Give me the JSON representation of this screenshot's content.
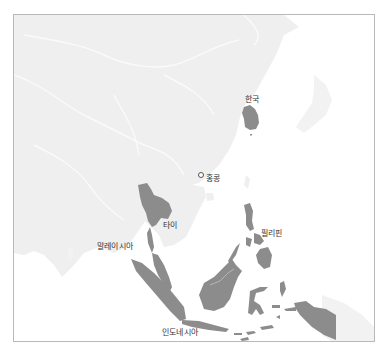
{
  "map": {
    "colors": {
      "ocean": "#ffffff",
      "land": "#efefef",
      "border_lines": "#fafafa",
      "highlight": "#8c8c8c",
      "frame": "#b9b9b9",
      "label": "#333333"
    },
    "labels": {
      "korea": "한국",
      "hongkong": "홍콩",
      "thailand": "타이",
      "philippines": "필리핀",
      "malaysia": "말레이시아",
      "indonesia": "인도네시아"
    },
    "highlighted_countries": [
      "한국",
      "타이",
      "필리핀",
      "말레이시아",
      "인도네시아"
    ],
    "point_markers": [
      "홍콩"
    ]
  }
}
